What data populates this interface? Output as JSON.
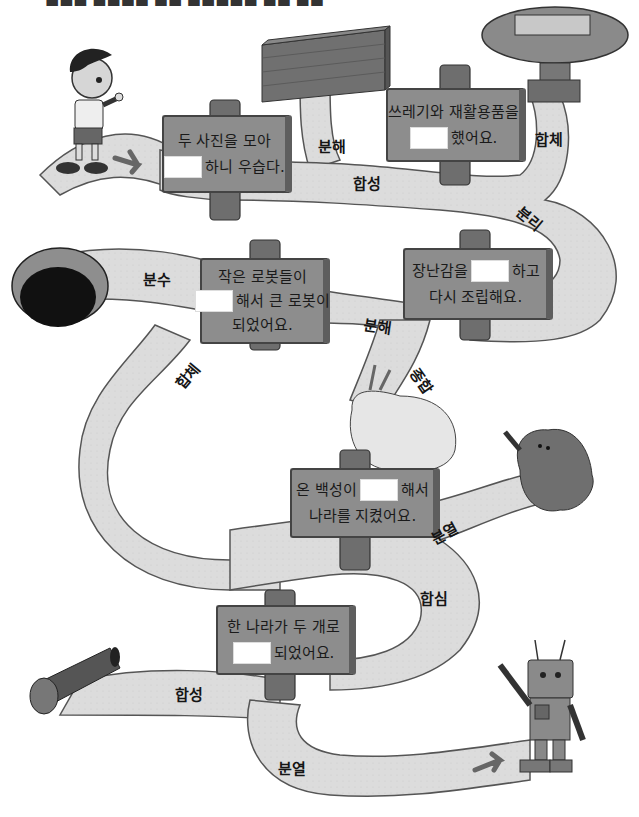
{
  "instruction_partial": "■■■ ■■■■ ■■ ■■■■■ ■■ ■■",
  "signs": [
    {
      "id": "sign-1",
      "line1": "두 사진을 모아",
      "line2_after": "하니 우습다.",
      "line2_before": "",
      "line3": ""
    },
    {
      "id": "sign-2",
      "line1": "쓰레기와 재활용품을",
      "line2_after": "했어요.",
      "line2_before": "",
      "line3": ""
    },
    {
      "id": "sign-3",
      "line1": "작은 로봇들이",
      "line2_after": "해서 큰 로봇이",
      "line2_before": "",
      "line3": "되었어요."
    },
    {
      "id": "sign-4",
      "line1_before": "장난감을",
      "line1_after": "하고",
      "line2": "다시 조립해요."
    },
    {
      "id": "sign-5",
      "line1_before": "온 백성이",
      "line1_after": "해서",
      "line2": "나라를 지켰어요."
    },
    {
      "id": "sign-6",
      "line1": "한 나라가 두 개로",
      "line2_after": "되었어요.",
      "line2_before": ""
    }
  ],
  "path_labels": [
    {
      "text": "분해",
      "near": "brick-wall"
    },
    {
      "text": "합체",
      "near": "capsule-machine"
    },
    {
      "text": "합성",
      "near": "top-path"
    },
    {
      "text": "분리",
      "near": "right-curve"
    },
    {
      "text": "분수",
      "near": "tunnel"
    },
    {
      "text": "분해",
      "near": "middle-path"
    },
    {
      "text": "합체",
      "near": "left-curve"
    },
    {
      "text": "종합",
      "near": "bush"
    },
    {
      "text": "분열",
      "near": "slime-monster"
    },
    {
      "text": "합심",
      "near": "right-bend"
    },
    {
      "text": "합성",
      "near": "cannon"
    },
    {
      "text": "분열",
      "near": "bottom-path"
    }
  ],
  "illustrations": [
    "boy-character",
    "brick-wall",
    "capsule-machine",
    "tunnel",
    "bush",
    "slime-monster",
    "cannon",
    "robot"
  ],
  "colors": {
    "path_fill": "#dcdcdc",
    "path_stroke": "#555555",
    "sign_fill": "#8d8d8d",
    "sign_side": "#5e5e5e",
    "post": "#6e6e6e",
    "blank": "#ffffff",
    "text": "#1a1a1a"
  }
}
